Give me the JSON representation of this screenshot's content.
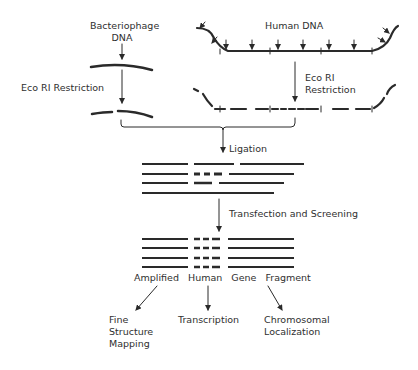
{
  "diagram": {
    "type": "flowchart",
    "sources": {
      "phage": {
        "label": "Bacteriophage\nDNA"
      },
      "human": {
        "label": "Human  DNA"
      }
    },
    "steps": {
      "phage_restriction": "Eco RI  Restriction",
      "human_restriction": "Eco RI\nRestriction",
      "ligation": "Ligation",
      "transfection": "Transfection and Screening"
    },
    "product": {
      "words": [
        "Amplified",
        "Human",
        "Gene",
        "Fragment"
      ]
    },
    "outcomes": [
      {
        "label": "Fine\nStructure\nMapping"
      },
      {
        "label": "Transcription"
      },
      {
        "label": "Chromosomal\nLocalization"
      }
    ],
    "colors": {
      "ink": "#2a2a2a",
      "background": "#ffffff"
    }
  }
}
